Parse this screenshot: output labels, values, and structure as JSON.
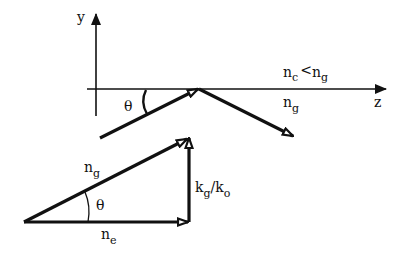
{
  "axes": {
    "y_label": "y",
    "z_label": "z"
  },
  "regions": {
    "cover": {
      "n": "n",
      "sub": "c",
      "relation": "<",
      "n2": "n",
      "sub2": "g"
    },
    "guide": {
      "n": "n",
      "sub": "g"
    }
  },
  "top_ray": {
    "angle_label": "θ"
  },
  "triangle": {
    "hypotenuse": {
      "n": "n",
      "sub": "g"
    },
    "base": {
      "n": "n",
      "sub": "e"
    },
    "vertical": {
      "k1": "k",
      "sub1": "g",
      "slash": "/",
      "k2": "k",
      "sub2": "o"
    },
    "angle_label": "θ"
  },
  "colors": {
    "ink": "#111111",
    "background": "#ffffff"
  }
}
